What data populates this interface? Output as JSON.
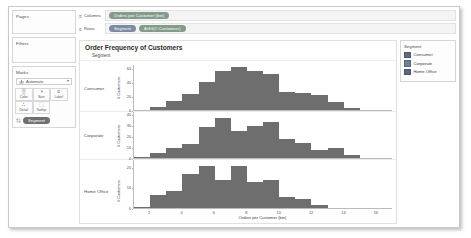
{
  "sidebar": {
    "pages": {
      "title": "Pages"
    },
    "filters": {
      "title": "Filters"
    },
    "marks": {
      "title": "Marks",
      "mark_type": "Automatic",
      "caret": "▾",
      "buttons": [
        {
          "name": "color",
          "label": "Color",
          "glyph": "▒"
        },
        {
          "name": "size",
          "label": "Size",
          "glyph": "◑"
        },
        {
          "name": "label",
          "label": "Label",
          "glyph": "≡"
        },
        {
          "name": "detail",
          "label": "Detail",
          "glyph": "∴"
        },
        {
          "name": "tooltip",
          "label": "Tooltip",
          "glyph": "⬚"
        }
      ],
      "encoding_pill": "Segment"
    }
  },
  "shelves": {
    "columns": {
      "label": "Columns",
      "glyph": "≡",
      "pills": [
        {
          "text": "Orders per Customer (bin)",
          "color": "green"
        }
      ]
    },
    "rows": {
      "label": "Rows",
      "glyph": "≡",
      "pills": [
        {
          "text": "Segment",
          "color": "blue"
        },
        {
          "text": "AGG(# Customers)",
          "color": "green"
        }
      ]
    }
  },
  "view": {
    "title": "Order Frequency of Customers",
    "column_header": "Segment"
  },
  "legend": {
    "title": "Segment",
    "items": [
      {
        "label": "Consumer",
        "color": "#5b6b84"
      },
      {
        "label": "Corporate",
        "color": "#6f7f93"
      },
      {
        "label": "Home Office",
        "color": "#59687f"
      }
    ]
  },
  "chart_data": {
    "type": "bar",
    "title": "Order Frequency of Customers",
    "xlabel": "Orders per Customer (bin)",
    "ylabel": "# Customers",
    "grid": false,
    "legend_position": "right",
    "xlim": [
      1,
      17
    ],
    "xticks": [
      2,
      4,
      6,
      8,
      10,
      12,
      14,
      16
    ],
    "bar_color": "#6e6e6e",
    "panels": [
      {
        "name": "Consumer",
        "row_label": "Consumer",
        "ylabel": "# Customers",
        "ylim": [
          0,
          65
        ],
        "yticks": [
          0,
          20,
          40,
          60
        ],
        "x": [
          1,
          2,
          3,
          4,
          5,
          6,
          7,
          8,
          9,
          10,
          11,
          12,
          13,
          14,
          15
        ],
        "values": [
          2,
          6,
          14,
          24,
          41,
          56,
          62,
          57,
          52,
          27,
          26,
          23,
          13,
          5,
          2
        ]
      },
      {
        "name": "Corporate",
        "row_label": "Corporate",
        "ylabel": "# Customers",
        "ylim": [
          0,
          42
        ],
        "yticks": [
          0,
          10,
          20,
          30,
          40
        ],
        "x": [
          1,
          2,
          3,
          4,
          5,
          6,
          7,
          8,
          9,
          10,
          11,
          12,
          13,
          14
        ],
        "values": [
          2,
          5,
          10,
          13,
          29,
          37,
          25,
          30,
          33,
          18,
          14,
          8,
          10,
          3
        ]
      },
      {
        "name": "Home Office",
        "row_label": "Home Office",
        "ylabel": "# Customers",
        "ylim": [
          0,
          24
        ],
        "yticks": [
          0,
          10,
          20
        ],
        "x": [
          1,
          2,
          3,
          4,
          5,
          6,
          7,
          8,
          9,
          10,
          11,
          12
        ],
        "values": [
          1,
          7,
          9,
          17,
          21,
          14,
          21,
          13,
          14,
          6,
          5,
          2
        ]
      }
    ]
  }
}
